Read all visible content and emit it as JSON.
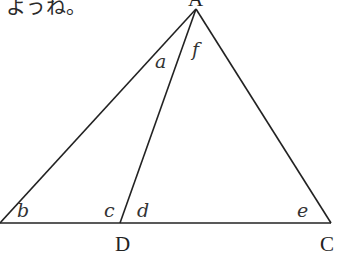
{
  "caption_fragment": "ようね。",
  "points": {
    "A": {
      "label": "A",
      "x": 196,
      "y": 9
    },
    "D": {
      "label": "D",
      "x": 120,
      "y": 223
    },
    "C": {
      "label": "C",
      "x": 331,
      "y": 223
    }
  },
  "angles": {
    "a": "a",
    "b": "b",
    "c": "c",
    "d": "d",
    "e": "e",
    "f": "f"
  }
}
